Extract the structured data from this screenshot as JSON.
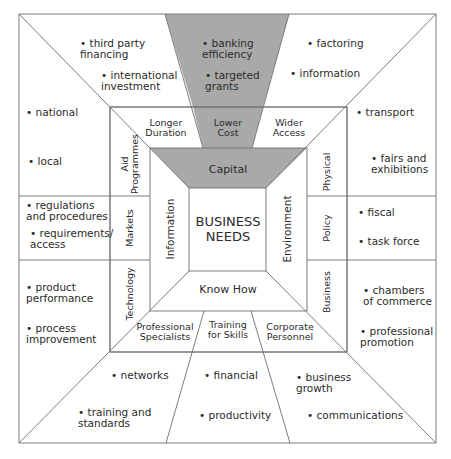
{
  "diagram": {
    "center": {
      "title": "BUSINESS\nNEEDS"
    },
    "inner_ring": {
      "top": "Capital",
      "left": "Information",
      "right": "Environment",
      "bottom": "Know How"
    },
    "middle_ring": {
      "top": [
        "Longer\nDuration",
        "Lower\nCost",
        "Wider\nAccess"
      ],
      "left": [
        "Aid\nProgrammes",
        "Markets",
        "Technology"
      ],
      "right": [
        "Physical",
        "Policy",
        "Business"
      ],
      "bottom": [
        "Professional\nSpecialists",
        "Training\nfor Skills",
        "Corporate\nPersonnel"
      ]
    },
    "outer_ring": {
      "top_left": [
        "third party\nfinancing",
        "international\ninvestment"
      ],
      "top_center": [
        "banking\nefficiency",
        "targeted\ngrants"
      ],
      "top_right": [
        "factoring",
        "information"
      ],
      "left_top": [
        "national",
        "local"
      ],
      "left_middle": [
        "regulations\nand procedures",
        "requirements/\naccess"
      ],
      "left_bottom": [
        "product\nperformance",
        "process\nimprovement"
      ],
      "right_top": [
        "transport",
        "fairs and\nexhibitions"
      ],
      "right_middle": [
        "fiscal",
        "task force"
      ],
      "right_bottom": [
        "chambers\nof commerce",
        "professional\npromotion"
      ],
      "bottom_left": [
        "networks",
        "training and\nstandards"
      ],
      "bottom_center": [
        "financial",
        "productivity"
      ],
      "bottom_right": [
        "business\ngrowth",
        "communications"
      ]
    },
    "bullet": "•",
    "colors": {
      "line": "#6e6e6e",
      "capital_fill": "#a9a9a9",
      "background": "#ffffff",
      "text": "#2b2b2b"
    }
  }
}
